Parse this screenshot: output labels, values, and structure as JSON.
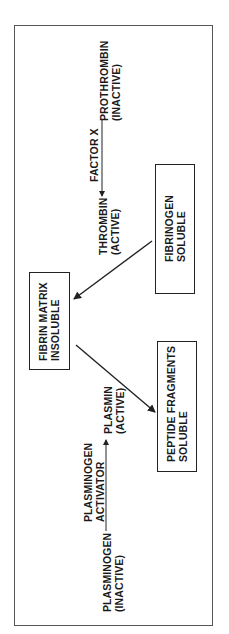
{
  "diagram": {
    "nodes": {
      "prothrombin": {
        "line1": "PROTHROMBIN",
        "line2": "(INACTIVE)"
      },
      "factor_x": {
        "label": "FACTOR X"
      },
      "thrombin": {
        "line1": "THROMBIN",
        "line2": "(ACTIVE)"
      },
      "fibrinogen": {
        "line1": "FIBRINOGEN",
        "line2": "SOLUBLE"
      },
      "fibrin_matrix": {
        "line1": "FIBRIN MATRIX",
        "line2": "INSOLUBLE"
      },
      "peptide_fragments": {
        "line1": "PEPTIDE FRAGMENTS",
        "line2": "SOLUBLE"
      },
      "plasminogen": {
        "line1": "PLASMINOGEN",
        "line2": "(INACTIVE)"
      },
      "plasminogen_activator": {
        "line1": "PLASMINOGEN",
        "line2": "ACTIVATOR"
      },
      "plasmin": {
        "line1": "PLASMIN",
        "line2": "(ACTIVE)"
      }
    },
    "edges": [
      {
        "from": "prothrombin",
        "to": "thrombin",
        "label": "FACTOR X"
      },
      {
        "from": "fibrinogen",
        "to": "fibrin_matrix",
        "label": ""
      },
      {
        "from": "fibrin_matrix",
        "to": "peptide_fragments",
        "label": ""
      },
      {
        "from": "plasminogen",
        "to": "plasmin",
        "label": "PLASMINOGEN ACTIVATOR"
      }
    ],
    "colors": {
      "line": "#222222",
      "frame": "#555555",
      "background": "#ffffff"
    }
  }
}
